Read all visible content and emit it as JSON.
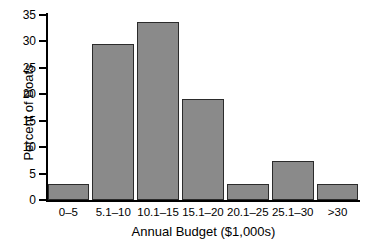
{
  "chart_data": {
    "type": "bar",
    "title": "",
    "xlabel": "Annual Budget ($1,000s)",
    "ylabel": "Percent of Boats",
    "categories": [
      "0–5",
      "5.1–10",
      "10.1–15",
      "15.1–20",
      "20.1–25",
      "25.1–30",
      ">30"
    ],
    "values": [
      3.0,
      29.5,
      33.7,
      19.1,
      3.0,
      7.3,
      3.0
    ],
    "ylim": [
      0,
      35
    ],
    "yticks": [
      0,
      5,
      10,
      15,
      20,
      25,
      30,
      35
    ],
    "ytick_labels": [
      "0",
      "5",
      "10",
      "15",
      "20",
      "25",
      "30",
      "35"
    ],
    "grid": false,
    "legend": "none",
    "bar_color": "#8a8a8a",
    "bar_edge_color": "#2b2b2b",
    "axis_color": "#000000",
    "background": "#ffffff"
  }
}
